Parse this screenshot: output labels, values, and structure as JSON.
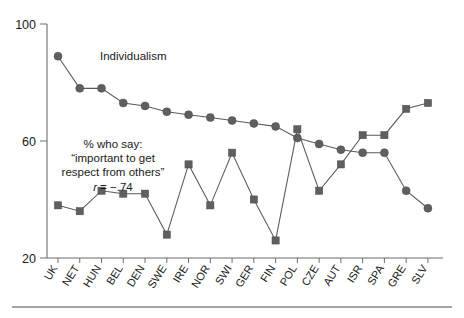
{
  "chart_data": {
    "type": "line",
    "title": "",
    "subtitle": "",
    "xlabel": "",
    "ylabel": "",
    "ylim": [
      20,
      100
    ],
    "y_ticks": [
      20,
      60,
      100
    ],
    "grid": false,
    "legend_position": "inline-annotation",
    "categories": [
      "UK",
      "NET",
      "HUN",
      "BEL",
      "DEN",
      "SWE",
      "IRE",
      "NOR",
      "SWI",
      "GER",
      "FIN",
      "POL",
      "CZE",
      "AUT",
      "ISR",
      "SPA",
      "GRE",
      "SLV"
    ],
    "series": [
      {
        "name": "Individualism",
        "marker": "circle",
        "values": [
          89,
          78,
          78,
          73,
          72,
          70,
          69,
          68,
          67,
          66,
          65,
          61,
          59,
          57,
          56,
          56,
          43,
          37
        ]
      },
      {
        "name": "% who say: \"important to get respect from others\"",
        "marker": "square",
        "values": [
          38,
          36,
          43,
          42,
          42,
          28,
          52,
          38,
          56,
          40,
          26,
          64,
          43,
          52,
          62,
          62,
          71,
          73
        ]
      }
    ],
    "annotations": [
      {
        "id": "individualism-label",
        "text": "Individualism",
        "x_px": 100,
        "y_px": 60
      },
      {
        "id": "respect-label-line1",
        "text": "% who say:",
        "x_px": 113,
        "y_px": 148
      },
      {
        "id": "respect-label-line2",
        "text": "“important to get",
        "x_px": 113,
        "y_px": 162
      },
      {
        "id": "respect-label-line3",
        "text": "respect from others”",
        "x_px": 113,
        "y_px": 176
      },
      {
        "id": "correlation",
        "text": "r = −.74",
        "x_px": 113,
        "y_px": 190
      }
    ]
  },
  "axes": {
    "y_tick_labels": [
      "100",
      "60",
      "20"
    ],
    "x_tick_labels": [
      "UK",
      "NET",
      "HUN",
      "BEL",
      "DEN",
      "SWE",
      "IRE",
      "NOR",
      "SWI",
      "GER",
      "FIN",
      "POL",
      "CZE",
      "AUT",
      "ISR",
      "SPA",
      "GRE",
      "SLV"
    ]
  },
  "annotations": {
    "individualism": "Individualism",
    "respect_line1": "% who say:",
    "respect_line2": "“important to get",
    "respect_line3": "respect from others”",
    "correlation_r": "r",
    "correlation_eq": "= −.74"
  },
  "colors": {
    "marker": "#5f5f5f",
    "line": "#5a5a5a",
    "axis": "#6d6d6d",
    "text": "#1a1a1a",
    "background": "#ffffff"
  }
}
